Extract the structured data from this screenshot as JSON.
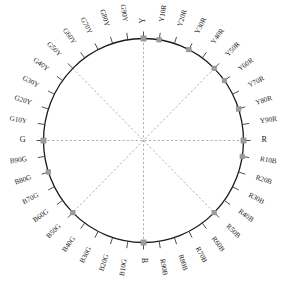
{
  "figure": {
    "name": "ncs-hue-circle",
    "geometry": {
      "center_x": 143.5,
      "center_y": 140.5,
      "radius_x": 100,
      "radius_y": 102,
      "tick_length": 7,
      "label_offset": 11
    },
    "colors": {
      "circle_stroke": "#1a1a1a",
      "tick_stroke": "#3a3a3a",
      "diagonal_stroke": "#9a9a9a",
      "label_fill": "#1a1a1a",
      "marker_fill": "#9c9c9c",
      "marker_stroke": "#8a8a8a",
      "background": "#ffffff"
    },
    "diagonals": [
      {
        "name": "vertical-axis",
        "angle_deg": 90
      },
      {
        "name": "horizontal-axis",
        "angle_deg": 0
      },
      {
        "name": "diagonal-y50r-b50g",
        "angle_deg": 45
      },
      {
        "name": "diagonal-g50y-r50b",
        "angle_deg": 135
      }
    ],
    "hues": [
      {
        "label": "Y",
        "angle_deg": 90,
        "marker": true,
        "cardinal": true
      },
      {
        "label": "Y10R",
        "angle_deg": 81,
        "marker": true,
        "cardinal": false
      },
      {
        "label": "Y20R",
        "angle_deg": 72,
        "marker": false,
        "cardinal": false
      },
      {
        "label": "Y30R",
        "angle_deg": 63,
        "marker": true,
        "cardinal": false
      },
      {
        "label": "Y40R",
        "angle_deg": 54,
        "marker": false,
        "cardinal": false
      },
      {
        "label": "Y50R",
        "angle_deg": 45,
        "marker": true,
        "cardinal": false
      },
      {
        "label": "Y60R",
        "angle_deg": 36,
        "marker": true,
        "cardinal": false
      },
      {
        "label": "Y70R",
        "angle_deg": 27,
        "marker": false,
        "cardinal": false
      },
      {
        "label": "Y80R",
        "angle_deg": 18,
        "marker": true,
        "cardinal": false
      },
      {
        "label": "Y90R",
        "angle_deg": 9,
        "marker": false,
        "cardinal": false
      },
      {
        "label": "R",
        "angle_deg": 0,
        "marker": true,
        "cardinal": true
      },
      {
        "label": "R10B",
        "angle_deg": -9,
        "marker": true,
        "cardinal": false
      },
      {
        "label": "R20B",
        "angle_deg": -18,
        "marker": false,
        "cardinal": false
      },
      {
        "label": "R30B",
        "angle_deg": -27,
        "marker": false,
        "cardinal": false
      },
      {
        "label": "R40B",
        "angle_deg": -36,
        "marker": false,
        "cardinal": false
      },
      {
        "label": "R50B",
        "angle_deg": -45,
        "marker": true,
        "cardinal": false
      },
      {
        "label": "R60B",
        "angle_deg": -54,
        "marker": false,
        "cardinal": false
      },
      {
        "label": "R70B",
        "angle_deg": -63,
        "marker": false,
        "cardinal": false
      },
      {
        "label": "R80B",
        "angle_deg": -72,
        "marker": false,
        "cardinal": false
      },
      {
        "label": "R90B",
        "angle_deg": -81,
        "marker": false,
        "cardinal": false
      },
      {
        "label": "B",
        "angle_deg": -90,
        "marker": true,
        "cardinal": true
      },
      {
        "label": "B10G",
        "angle_deg": -99,
        "marker": false,
        "cardinal": false
      },
      {
        "label": "B20G",
        "angle_deg": -108,
        "marker": false,
        "cardinal": false
      },
      {
        "label": "B30G",
        "angle_deg": -117,
        "marker": false,
        "cardinal": false
      },
      {
        "label": "B40G",
        "angle_deg": -126,
        "marker": false,
        "cardinal": false
      },
      {
        "label": "B50G",
        "angle_deg": -135,
        "marker": true,
        "cardinal": false
      },
      {
        "label": "B60G",
        "angle_deg": -144,
        "marker": false,
        "cardinal": false
      },
      {
        "label": "B70G",
        "angle_deg": -153,
        "marker": false,
        "cardinal": false
      },
      {
        "label": "B80G",
        "angle_deg": -162,
        "marker": true,
        "cardinal": false
      },
      {
        "label": "B90G",
        "angle_deg": -171,
        "marker": false,
        "cardinal": false
      },
      {
        "label": "G",
        "angle_deg": 180,
        "marker": true,
        "cardinal": true
      },
      {
        "label": "G10Y",
        "angle_deg": 171,
        "marker": false,
        "cardinal": false
      },
      {
        "label": "G20Y",
        "angle_deg": 162,
        "marker": false,
        "cardinal": false
      },
      {
        "label": "G30Y",
        "angle_deg": 153,
        "marker": false,
        "cardinal": false
      },
      {
        "label": "G40Y",
        "angle_deg": 144,
        "marker": false,
        "cardinal": false
      },
      {
        "label": "G50Y",
        "angle_deg": 135,
        "marker": false,
        "cardinal": false
      },
      {
        "label": "G60Y",
        "angle_deg": 126,
        "marker": false,
        "cardinal": false
      },
      {
        "label": "G70Y",
        "angle_deg": 117,
        "marker": false,
        "cardinal": false
      },
      {
        "label": "G80Y",
        "angle_deg": 108,
        "marker": false,
        "cardinal": false
      },
      {
        "label": "G90Y",
        "angle_deg": 99,
        "marker": false,
        "cardinal": false
      }
    ]
  }
}
